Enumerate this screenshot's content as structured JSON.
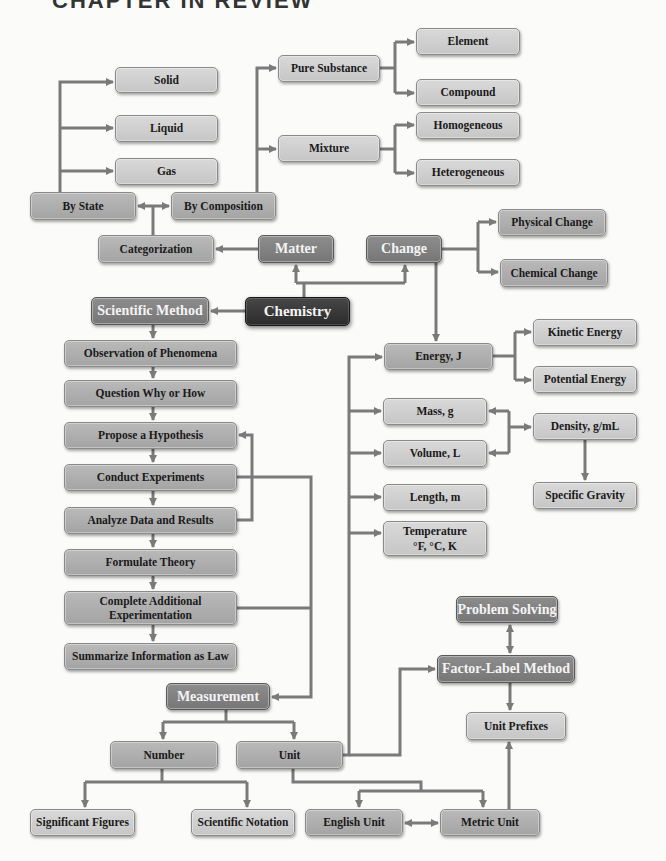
{
  "header": {
    "text": "CHAPTER IN REVIEW"
  },
  "colors": {
    "connector": "#7a7a7a",
    "light_box": "#d0d0d0",
    "mid_box": "#afafaf",
    "key_box": "#828282",
    "root_box": "#3a3a3a"
  },
  "nodes": {
    "chemistry": "Chemistry",
    "matter": "Matter",
    "change": "Change",
    "categorization": "Categorization",
    "by_state": "By State",
    "by_composition": "By Composition",
    "solid": "Solid",
    "liquid": "Liquid",
    "gas": "Gas",
    "pure_substance": "Pure Substance",
    "mixture": "Mixture",
    "element": "Element",
    "compound": "Compound",
    "homogeneous": "Homogeneous",
    "heterogeneous": "Heterogeneous",
    "physical_change": "Physical Change",
    "chemical_change": "Chemical Change",
    "scientific_method": "Scientific Method",
    "observation": "Observation of Phenomena",
    "question": "Question Why or How",
    "hypothesis": "Propose a Hypothesis",
    "experiments": "Conduct Experiments",
    "analyze": "Analyze Data and Results",
    "theory": "Formulate Theory",
    "additional_line1": "Complete Additional",
    "additional_line2": "Experimentation",
    "law": "Summarize Information as Law",
    "measurement": "Measurement",
    "number": "Number",
    "unit": "Unit",
    "significant_figures": "Significant Figures",
    "scientific_notation": "Scientific Notation",
    "english_unit": "English Unit",
    "metric_unit": "Metric Unit",
    "energy": "Energy, J",
    "kinetic_energy": "Kinetic Energy",
    "potential_energy": "Potential Energy",
    "mass": "Mass, g",
    "volume": "Volume, L",
    "length": "Length, m",
    "temperature_line1": "Temperature",
    "temperature_line2": "°F, °C, K",
    "density": "Density, g/mL",
    "specific_gravity": "Specific Gravity",
    "problem_solving": "Problem Solving",
    "factor_label": "Factor-Label Method",
    "unit_prefixes": "Unit Prefixes"
  }
}
